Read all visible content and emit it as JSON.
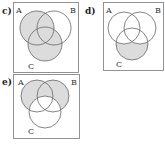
{
  "diagrams": [
    {
      "id": "c",
      "label": "c)",
      "sets": [
        "A",
        "B",
        "C"
      ],
      "shaded": "A ∪ C",
      "shaded_regions": [
        "A-only",
        "A∩B-only",
        "A∩C-only",
        "A∩B∩C",
        "C-only",
        "B∩C-only"
      ]
    },
    {
      "id": "d",
      "label": "d)",
      "sets": [
        "A",
        "B",
        "C"
      ],
      "shaded": "C − (A ∪ B)",
      "shaded_regions": [
        "C-only"
      ]
    },
    {
      "id": "e",
      "label": "e)",
      "sets": [
        "A",
        "B",
        "C"
      ],
      "shaded": "(A ∪ B) − C",
      "shaded_regions": [
        "A-only",
        "B-only",
        "A∩B-only"
      ]
    }
  ],
  "colors": {
    "shade": "#dcdcdc",
    "stroke": "#666666",
    "frame": "#888888"
  }
}
